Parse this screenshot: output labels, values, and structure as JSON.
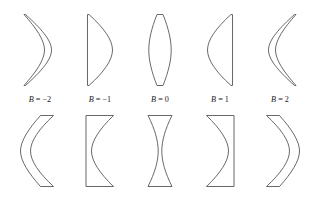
{
  "figure": {
    "background_color": "#ffffff",
    "stroke_color": "#58585a",
    "label_color": "#1a1a1a",
    "variable_symbol": "B",
    "rows": [
      {
        "name": "positive-lenses",
        "description": "Converging (positive) lens cross-sections",
        "lenses": [
          {
            "label_value": "-2",
            "form": "meniscus-convex-right",
            "edge_thickness": 1.5,
            "center_thickness": 13.5
          },
          {
            "label_value": "-1",
            "form": "plano-convex-flat-left",
            "edge_thickness": 1.5,
            "center_thickness": 13.5
          },
          {
            "label_value": "0",
            "form": "biconvex-equiconvex",
            "edge_thickness": 1.5,
            "center_thickness": 13.5
          },
          {
            "label_value": "1",
            "form": "plano-convex-flat-right",
            "edge_thickness": 1.5,
            "center_thickness": 13.5
          },
          {
            "label_value": "2",
            "form": "meniscus-convex-left",
            "edge_thickness": 1.5,
            "center_thickness": 13.5
          }
        ]
      },
      {
        "name": "negative-lenses",
        "description": "Diverging (negative) lens cross-sections",
        "lenses": [
          {
            "label_value": "-2",
            "form": "meniscus-concave-right",
            "edge_thickness": 14.0,
            "center_thickness": 2.5
          },
          {
            "label_value": "-1",
            "form": "plano-concave-flat-left",
            "edge_thickness": 14.0,
            "center_thickness": 2.5
          },
          {
            "label_value": "0",
            "form": "biconcave-equiconcave",
            "edge_thickness": 14.0,
            "center_thickness": 2.5
          },
          {
            "label_value": "1",
            "form": "plano-concave-flat-right",
            "edge_thickness": 14.0,
            "center_thickness": 2.5
          },
          {
            "label_value": "2",
            "form": "meniscus-concave-left",
            "edge_thickness": 14.0,
            "center_thickness": 2.5
          }
        ]
      }
    ],
    "labels": [
      {
        "text": "B = −2",
        "value": "−2"
      },
      {
        "text": "B = −1",
        "value": "−1"
      },
      {
        "text": "B = 0",
        "value": "0"
      },
      {
        "text": "B = 1",
        "value": "1"
      },
      {
        "text": "B = 2",
        "value": "2"
      }
    ],
    "geometry": {
      "columns_center_x": [
        40,
        100,
        160,
        220,
        280
      ],
      "top_row_y_top": 14,
      "top_row_y_bottom": 86,
      "label_baseline_y": 102,
      "bottom_row_y_top": 115,
      "bottom_row_y_bottom": 187
    }
  }
}
